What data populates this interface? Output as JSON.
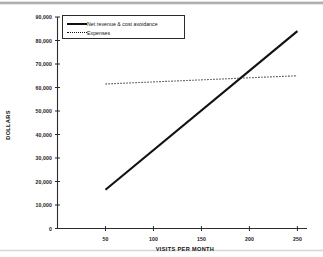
{
  "chart_data": {
    "type": "line",
    "title": "",
    "subtitle": "",
    "xlabel": "VISITS PER MONTH",
    "ylabel": "DOLLARS",
    "xlim": [
      0,
      260
    ],
    "ylim": [
      0,
      90000
    ],
    "grid": false,
    "legend_position": "upper-left-inside",
    "x_ticks": [
      50,
      100,
      150,
      200,
      250
    ],
    "x_tick_labels": [
      "50",
      "100",
      "150",
      "200",
      "250"
    ],
    "y_ticks": [
      0,
      10000,
      20000,
      30000,
      40000,
      50000,
      60000,
      70000,
      80000,
      90000
    ],
    "y_tick_labels": [
      "0",
      "10,000",
      "20,000",
      "30,000",
      "40,000",
      "50,000",
      "60,000",
      "70,000",
      "80,000",
      "90,000"
    ],
    "x": [
      50,
      250
    ],
    "series": [
      {
        "name": "Net revenue & cost avoidance",
        "style": "solid",
        "width": "thick",
        "color": "#111111",
        "x": [
          50,
          250
        ],
        "values": [
          16500,
          84000
        ]
      },
      {
        "name": "Expenses",
        "style": "dotted",
        "width": "thin",
        "color": "#111111",
        "x": [
          50,
          250
        ],
        "values": [
          61500,
          65000
        ]
      }
    ],
    "annotations": [
      {
        "label": "break-even crossing",
        "x": 190,
        "y": 64000
      }
    ]
  },
  "legend": {
    "entries": [
      {
        "label": "Net revenue & cost avoidance",
        "marker": "solid-line-swatch"
      },
      {
        "label": "Expenses",
        "marker": "dotted-line-swatch"
      }
    ]
  },
  "axes": {
    "x_title": "VISITS PER MONTH",
    "y_title": "DOLLARS"
  }
}
